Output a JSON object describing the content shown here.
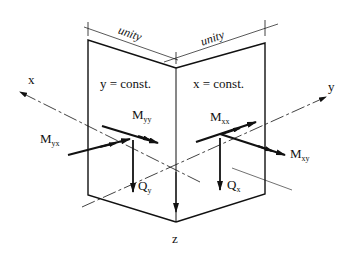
{
  "figure": {
    "type": "plate element free-body diagram",
    "panels": [
      {
        "id": "left",
        "label": "y = const.",
        "dimension_label": "unity"
      },
      {
        "id": "right",
        "label": "x = const.",
        "dimension_label": "unity"
      }
    ],
    "axes": {
      "x": "x",
      "y": "y",
      "z": "z"
    },
    "moments": {
      "Myx": {
        "main": "M",
        "sub": "yx"
      },
      "Myy": {
        "main": "M",
        "sub": "yy"
      },
      "Mxx": {
        "main": "M",
        "sub": "xx"
      },
      "Mxy": {
        "main": "M",
        "sub": "xy"
      }
    },
    "shear_forces": {
      "Qy": {
        "main": "Q",
        "sub": "y"
      },
      "Qx": {
        "main": "Q",
        "sub": "x"
      }
    },
    "colors": {
      "line": "#111111",
      "background": "#ffffff"
    }
  }
}
